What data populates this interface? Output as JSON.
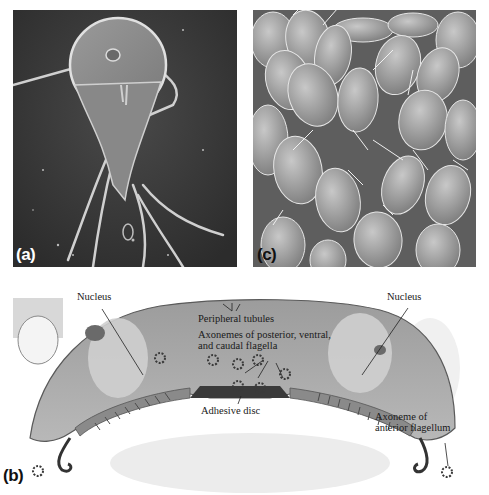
{
  "figure": {
    "panels": [
      {
        "id": "a",
        "label": "(a)",
        "description": "Scanning electron micrograph of a single Giardia trophozoite with flagella"
      },
      {
        "id": "c",
        "label": "(c)",
        "description": "Scanning electron micrograph of many trophozoites attached to intestinal surface"
      },
      {
        "id": "b",
        "label": "(b)",
        "description": "Transmission electron micrograph cross-section of trophozoite"
      }
    ],
    "annotations": {
      "nucleus_left": "Nucleus",
      "nucleus_right": "Nucleus",
      "peripheral_tubules": "Peripheral tubules",
      "axonemes_line1": "Axonemes of posterior, ventral,",
      "axonemes_line2": "and caudal flagella",
      "adhesive_disc": "Adhesive disc",
      "anterior_line1": "Axoneme of",
      "anterior_line2": "anterior flagellum"
    }
  }
}
